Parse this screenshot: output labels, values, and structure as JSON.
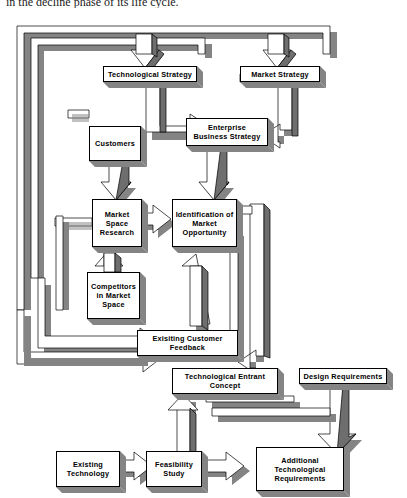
{
  "page": {
    "caption_above": "in the decline phase of its life cycle."
  },
  "diagram": {
    "style": {
      "box_fill": "#ffffff",
      "box_border": "#000000",
      "shadow": "#808080",
      "arrow_face": "#ffffff",
      "arrow_side": "#6e6e6e",
      "text": "#000000"
    },
    "nodes": [
      {
        "id": "technological-strategy",
        "label": "Technological Strategy",
        "x": 103,
        "y": 56,
        "w": 94,
        "h": 16
      },
      {
        "id": "market-strategy",
        "label": "Market Strategy",
        "x": 240,
        "y": 56,
        "w": 80,
        "h": 16
      },
      {
        "id": "enterprise-business-strategy",
        "label": "Enterprise\nBusiness Strategy",
        "x": 186,
        "y": 108,
        "w": 82,
        "h": 28
      },
      {
        "id": "customers",
        "label": "Customers",
        "x": 89,
        "y": 116,
        "w": 52,
        "h": 35
      },
      {
        "id": "market-space-research",
        "label": "Market\nSpace\nResearch",
        "x": 92,
        "y": 189,
        "w": 50,
        "h": 48
      },
      {
        "id": "identification-of-market-opportunity",
        "label": "Identification of\nMarket\nOpportunity",
        "x": 172,
        "y": 189,
        "w": 65,
        "h": 48
      },
      {
        "id": "competitors-in-market-space",
        "label": "Competitors\nin Market\nSpace",
        "x": 87,
        "y": 262,
        "w": 53,
        "h": 47
      },
      {
        "id": "exisiting-customer-feedback",
        "label": "Exisiting Customer\nFeedback",
        "x": 137,
        "y": 320,
        "w": 101,
        "h": 26
      },
      {
        "id": "technological-entrant-concept",
        "label": "Technological Entrant\nConcept",
        "x": 172,
        "y": 358,
        "w": 106,
        "h": 26
      },
      {
        "id": "design-requirements",
        "label": "Design Requirements",
        "x": 299,
        "y": 358,
        "w": 88,
        "h": 16
      },
      {
        "id": "existing-technology",
        "label": "Existing\nTechnology",
        "x": 56,
        "y": 441,
        "w": 64,
        "h": 36
      },
      {
        "id": "feasibility-study",
        "label": "Feasibility\nStudy",
        "x": 146,
        "y": 441,
        "w": 56,
        "h": 36
      },
      {
        "id": "additional-technological-requirements",
        "label": "Additional\nTechnological\nRequirements",
        "x": 256,
        "y": 437,
        "w": 88,
        "h": 44
      }
    ],
    "edges": [
      {
        "from": "feedback-loop-outer",
        "to": "technological-strategy"
      },
      {
        "from": "feedback-loop-outer",
        "to": "market-strategy"
      },
      {
        "from": "technological-strategy",
        "to": "enterprise-business-strategy"
      },
      {
        "from": "market-strategy",
        "to": "enterprise-business-strategy"
      },
      {
        "from": "customers",
        "to": "market-space-research"
      },
      {
        "from": "market-space-research",
        "to": "identification-of-market-opportunity"
      },
      {
        "from": "competitors-in-market-space",
        "to": "market-space-research"
      },
      {
        "from": "enterprise-business-strategy",
        "to": "identification-of-market-opportunity"
      },
      {
        "from": "exisiting-customer-feedback",
        "to": "identification-of-market-opportunity"
      },
      {
        "from": "left-return-channel",
        "to": "exisiting-customer-feedback"
      },
      {
        "from": "identification-of-market-opportunity",
        "to": "technological-entrant-concept"
      },
      {
        "from": "technological-entrant-concept",
        "to": "feasibility-study"
      },
      {
        "from": "existing-technology",
        "to": "feasibility-study"
      },
      {
        "from": "feasibility-study",
        "to": "additional-technological-requirements"
      },
      {
        "from": "design-requirements",
        "to": "additional-technological-requirements"
      }
    ]
  }
}
